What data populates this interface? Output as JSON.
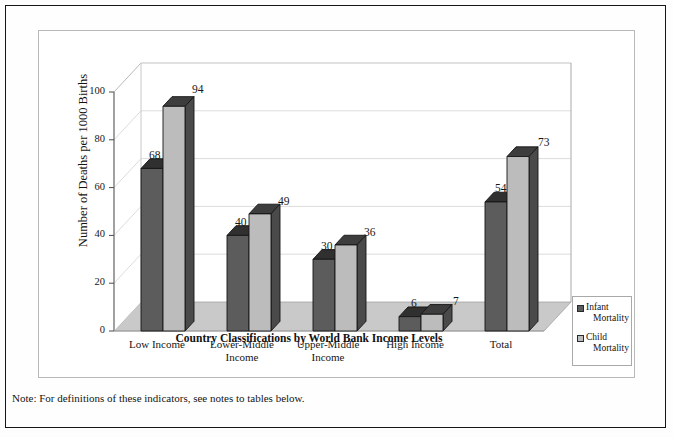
{
  "note": "Note: For definitions of these indicators, see notes to tables below.",
  "legend": {
    "items": [
      {
        "label": "Infant Mortality",
        "line1": "Infant",
        "line2": "Mortality",
        "color": "#5c5c5c",
        "icon": "legend-swatch-icon"
      },
      {
        "label": "Child Mortality",
        "line1": "Child",
        "line2": "Mortality",
        "color": "#bcbcbc",
        "icon": "legend-swatch-icon"
      }
    ]
  },
  "chart_data": {
    "type": "bar",
    "title": "",
    "xlabel": "Country Classifications by World Bank Income Levels",
    "ylabel": "Number of Deaths per 1000 Births",
    "categories": [
      "Low Income",
      "Lower-Middle Income",
      "Upper-Middle Income",
      "High Income",
      "Total"
    ],
    "category_lines": [
      [
        "Low Income",
        ""
      ],
      [
        "Lower-Middle",
        "Income"
      ],
      [
        "Upper-Middle",
        "Income"
      ],
      [
        "High Income",
        ""
      ],
      [
        "Total",
        ""
      ]
    ],
    "series": [
      {
        "name": "Infant Mortality",
        "color": "#5c5c5c",
        "values": [
          68,
          40,
          30,
          6,
          54
        ]
      },
      {
        "name": "Child Mortality",
        "color": "#bcbcbc",
        "values": [
          94,
          49,
          36,
          7,
          73
        ]
      }
    ],
    "ylim": [
      0,
      100
    ],
    "yticks": [
      0,
      20,
      40,
      60,
      80,
      100
    ],
    "ytick_labels": [
      "0",
      "20",
      "40",
      "60",
      "80",
      "100"
    ],
    "grid": true,
    "grid_axis": "y",
    "legend_position": "right",
    "projection": "3d-columns"
  },
  "colors": {
    "infant_front": "#5c5c5c",
    "infant_side": "#3a3a3a",
    "infant_top": "#303030",
    "child_front": "#bcbcbc",
    "child_side": "#4a4a4a",
    "child_top": "#3d3d3d",
    "floor": "#c9c9c9",
    "floor_side": "#b4b4b4",
    "wall": "#ffffff",
    "grid": "#d8d8d8",
    "axis": "#6e6e6e",
    "frame": "#b9b9b9",
    "outer_frame": "#151515"
  }
}
